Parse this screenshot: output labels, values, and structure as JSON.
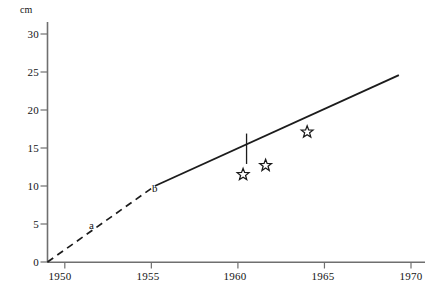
{
  "chart_data": {
    "type": "line",
    "title": "",
    "xlabel": "",
    "ylabel": "",
    "yunit": "cm",
    "xlim": [
      1949,
      1970
    ],
    "ylim": [
      0,
      31
    ],
    "grid": false,
    "legend": false,
    "y_ticks": [
      0,
      5,
      10,
      15,
      20,
      25,
      30
    ],
    "y_tick_labels": [
      "0",
      "5",
      "10",
      "15",
      "20",
      "25",
      "30"
    ],
    "x_ticks": [
      1950,
      1955,
      1960,
      1965,
      1970
    ],
    "x_tick_labels": [
      "1950",
      "1955",
      "1960",
      "1965",
      "1970"
    ],
    "series": [
      {
        "name": "a",
        "style": "dashed",
        "label": "a",
        "label_x": 1951.5,
        "label_y": 5.7,
        "points": [
          {
            "x": 1949.0,
            "y": 0.0
          },
          {
            "x": 1955.2,
            "y": 10.0
          }
        ]
      },
      {
        "name": "b",
        "style": "solid",
        "label": "b",
        "label_x": 1954.9,
        "label_y": 11.6,
        "points": [
          {
            "x": 1955.2,
            "y": 10.0
          },
          {
            "x": 1969.3,
            "y": 24.6
          }
        ]
      }
    ],
    "markers": [
      {
        "shape": "star",
        "x": 1960.3,
        "y": 11.5
      },
      {
        "shape": "star",
        "x": 1961.6,
        "y": 12.7
      },
      {
        "shape": "star",
        "x": 1964.0,
        "y": 17.1
      }
    ],
    "annotations": [
      {
        "type": "vertical-tick",
        "x": 1960.5,
        "y": 14.9,
        "half_length": 2.0
      }
    ]
  },
  "colors": {
    "axis": "#6f6f6f",
    "line": "#1c1c1c",
    "text": "#131313",
    "marker": "#1a1a1a",
    "background": "#ffffff"
  },
  "axis_labels": {
    "unit": "cm",
    "y": [
      "30",
      "25",
      "20",
      "15",
      "10",
      "5",
      "0"
    ],
    "x": [
      "1950",
      "1955",
      "1960",
      "1965",
      "1970"
    ]
  },
  "segment_labels": {
    "a": "a",
    "b": "b"
  }
}
